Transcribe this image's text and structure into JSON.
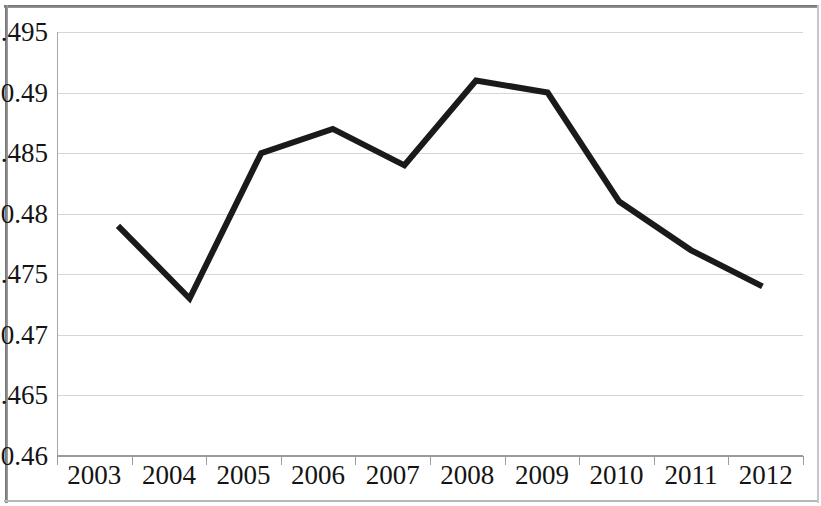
{
  "chart_data": {
    "type": "line",
    "title": "",
    "subtitle": "",
    "xlabel": "",
    "ylabel": "",
    "categories": [
      "2003",
      "2004",
      "2005",
      "2006",
      "2007",
      "2008",
      "2009",
      "2010",
      "2011",
      "2012"
    ],
    "series": [
      {
        "name": "",
        "values": [
          0.479,
          0.473,
          0.485,
          0.487,
          0.484,
          0.491,
          0.49,
          0.481,
          0.477,
          0.474
        ]
      }
    ],
    "ylim": [
      0.46,
      0.495
    ],
    "ytick_step": 0.005,
    "ytick_labels": [
      "0.46",
      "0.465",
      "0.47",
      "0.475",
      "0.48",
      "0.485",
      "0.49",
      "0.495"
    ],
    "ytick_values": [
      0.46,
      0.465,
      0.47,
      0.475,
      0.48,
      0.485,
      0.49,
      0.495
    ],
    "grid": true,
    "grid_axis": "y",
    "legend": false,
    "legend_position": "none",
    "markers": false,
    "annotations": [],
    "colors": {
      "line": "#1a1a1a",
      "gridline": "#d6d6d6",
      "axis": "#9b9b9b",
      "text": "#141414",
      "background": "#ffffff",
      "frame": "#6e6e6e"
    },
    "line_width_px": 6
  }
}
